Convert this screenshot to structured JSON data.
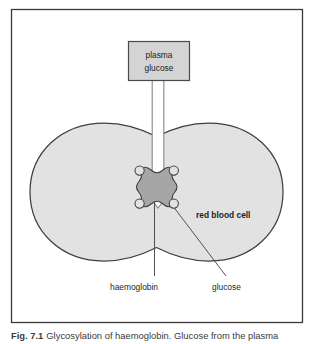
{
  "figure": {
    "frame": {
      "border_color": "#3a3a3a",
      "background": "#ffffff"
    },
    "source_box": {
      "line1": "plasma",
      "line2": "glucose",
      "fill_color": "#d4d4d4",
      "border_color": "#4a4a4a"
    },
    "arrow": {
      "name": "downward-block-arrow",
      "fill_color": "#ffffff",
      "border_color": "#8c8c8c",
      "direction": "down"
    },
    "cell": {
      "label": "red blood cell",
      "fill_color": "#e2e2e2",
      "border_color": "#3f3f3f",
      "shape": "biconcave-two-lobes"
    },
    "haemoglobin": {
      "label": "haemoglobin",
      "fill_color": "#a6a6a6",
      "border_color": "#3f3f3f",
      "shape": "scalloped-rounded-square"
    },
    "glucose": {
      "label": "glucose",
      "fill_color": "#e2e2e2",
      "border_color": "#3f3f3f",
      "shape": "small-circle",
      "count": 4
    }
  },
  "caption": {
    "number": "Fig. 7.1",
    "text": "Glycosylation of haemoglobin. Glucose from the plasma"
  }
}
